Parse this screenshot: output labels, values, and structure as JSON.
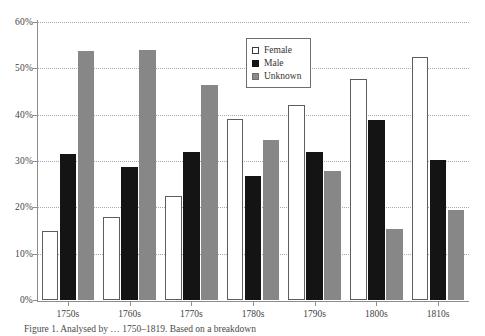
{
  "chart_data": {
    "type": "bar",
    "title": "",
    "xlabel": "",
    "ylabel": "",
    "categories": [
      "1750s",
      "1760s",
      "1770s",
      "1780s",
      "1790s",
      "1800s",
      "1810s"
    ],
    "series": [
      {
        "name": "Female",
        "color": "#ffffff",
        "values": [
          15.0,
          18.0,
          22.5,
          39.0,
          42.0,
          47.7,
          52.5
        ]
      },
      {
        "name": "Male",
        "color": "#141414",
        "values": [
          31.6,
          28.7,
          32.0,
          26.7,
          32.0,
          38.8,
          30.3
        ]
      },
      {
        "name": "Unknown",
        "color": "#878787",
        "values": [
          53.7,
          54.0,
          46.3,
          34.5,
          27.8,
          15.3,
          19.5
        ]
      }
    ],
    "ylim": [
      0,
      60
    ],
    "yticks": [
      0,
      10,
      20,
      30,
      40,
      50,
      60
    ],
    "ytick_labels": [
      "0%",
      "10%",
      "20%",
      "30%",
      "40%",
      "50%",
      "60%"
    ],
    "grid": true,
    "legend_position": "top-center"
  },
  "legend": {
    "entries": [
      {
        "label": "Female",
        "swatch": "female-swatch"
      },
      {
        "label": "Male",
        "swatch": "male-swatch"
      },
      {
        "label": "Unknown",
        "swatch": "unknown-swatch"
      }
    ]
  },
  "caption": {
    "text": "Figure 1. Analysed by … 1750–1819. Based on a breakdown"
  }
}
